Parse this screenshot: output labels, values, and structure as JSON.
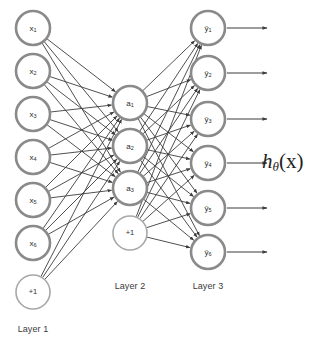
{
  "figure": {
    "type": "neural-network-diagram",
    "title": "",
    "background_color": "#ffffff",
    "node_stroke_color": "#8a8a8a",
    "bias_stroke_color": "#a8a8a8",
    "node_fill_color": "#ffffff",
    "edge_color": "#3c3c3c",
    "text_color": "#2b2b2b"
  },
  "hypothesis": {
    "base": "h",
    "subscript": "θ",
    "argument": "(x)",
    "full": "hθ(x)"
  },
  "layers": [
    {
      "id": "layer1",
      "caption": "Layer 1",
      "caption_x": 33,
      "caption_y": 330,
      "center_x": 33,
      "radius": 17,
      "nodes": [
        {
          "id": "x1",
          "base": "x",
          "sub": "1",
          "cy": 28,
          "bias": false
        },
        {
          "id": "x2",
          "base": "x",
          "sub": "2",
          "cy": 71,
          "bias": false
        },
        {
          "id": "x3",
          "base": "x",
          "sub": "3",
          "cy": 114,
          "bias": false
        },
        {
          "id": "x4",
          "base": "x",
          "sub": "4",
          "cy": 157,
          "bias": false
        },
        {
          "id": "x5",
          "base": "x",
          "sub": "5",
          "cy": 200,
          "bias": false
        },
        {
          "id": "x6",
          "base": "x",
          "sub": "6",
          "cy": 243,
          "bias": false
        },
        {
          "id": "b1",
          "base": "+1",
          "sub": "",
          "cy": 292,
          "bias": true
        }
      ]
    },
    {
      "id": "layer2",
      "caption": "Layer 2",
      "caption_x": 130,
      "caption_y": 287,
      "center_x": 130,
      "radius": 17,
      "nodes": [
        {
          "id": "a1",
          "base": "a",
          "sub": "1",
          "cy": 103,
          "bias": false
        },
        {
          "id": "a2",
          "base": "a",
          "sub": "2",
          "cy": 146,
          "bias": false
        },
        {
          "id": "a3",
          "base": "a",
          "sub": "3",
          "cy": 188,
          "bias": false
        },
        {
          "id": "b2",
          "base": "+1",
          "sub": "",
          "cy": 233,
          "bias": true
        }
      ]
    },
    {
      "id": "layer3",
      "caption": "Layer 3",
      "caption_x": 208,
      "caption_y": 287,
      "center_x": 208,
      "radius": 17,
      "nodes": [
        {
          "id": "y1",
          "base": "ŷ",
          "sub": "1",
          "cy": 28,
          "bias": false,
          "arrow": true
        },
        {
          "id": "y2",
          "base": "ŷ",
          "sub": "2",
          "cy": 73,
          "bias": false,
          "arrow": true
        },
        {
          "id": "y3",
          "base": "ŷ",
          "sub": "3",
          "cy": 119,
          "bias": false,
          "arrow": true
        },
        {
          "id": "y4",
          "base": "ŷ",
          "sub": "4",
          "cy": 163,
          "bias": false,
          "arrow": true
        },
        {
          "id": "y5",
          "base": "ŷ",
          "sub": "5",
          "cy": 208,
          "bias": false,
          "arrow": true
        },
        {
          "id": "y6",
          "base": "ŷ",
          "sub": "6",
          "cy": 252,
          "bias": false,
          "arrow": true
        }
      ]
    }
  ],
  "connections": {
    "layer1_to_layer2": {
      "from": [
        "x1",
        "x2",
        "x3",
        "x4",
        "x5",
        "x6",
        "b1"
      ],
      "to": [
        "a1",
        "a2",
        "a3"
      ],
      "arrowheads": true
    },
    "layer2_to_layer3": {
      "from": [
        "a1",
        "a2",
        "a3",
        "b2"
      ],
      "to": [
        "y1",
        "y2",
        "y3",
        "y4",
        "y5",
        "y6"
      ],
      "arrowheads": true
    }
  },
  "output_arrows": {
    "length": 40,
    "arrowheads": true
  }
}
